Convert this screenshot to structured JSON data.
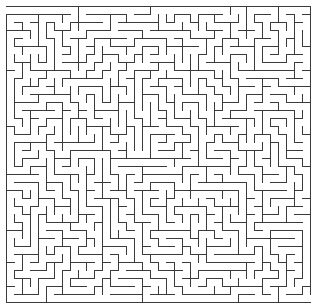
{
  "maze": {
    "label": "Maze puzzle",
    "width_px": 319,
    "height_px": 306,
    "origin": {
      "x": 6,
      "y": 6
    },
    "cols": 38,
    "rows": 37,
    "cell_size": 8,
    "wall_color": "#3a3a3a",
    "wall_width": 1,
    "background": "#ffffff",
    "entrance": {
      "side": "left",
      "row": 0
    },
    "exit": {
      "side": "right",
      "row": 36
    },
    "seed": 20240611
  }
}
